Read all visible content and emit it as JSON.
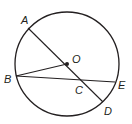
{
  "diagram": {
    "type": "circle-geometry",
    "circle": {
      "center_label": "O",
      "cx": 67,
      "cy": 64,
      "r": 52
    },
    "points": {
      "A": {
        "label": "A",
        "x": 28,
        "y": 28
      },
      "B": {
        "label": "B",
        "x": 16,
        "y": 76
      },
      "C": {
        "label": "C",
        "x": 84,
        "y": 79
      },
      "D": {
        "label": "D",
        "x": 103,
        "y": 102
      },
      "E": {
        "label": "E",
        "x": 115,
        "y": 82
      },
      "O": {
        "label": "O",
        "x": 67,
        "y": 64
      }
    },
    "segments": [
      "AD",
      "BE",
      "BO"
    ],
    "line_color": "#231f20"
  }
}
